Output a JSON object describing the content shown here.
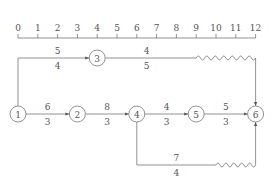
{
  "timescale": {
    "ticks": [
      "0",
      "1",
      "2",
      "3",
      "4",
      "5",
      "6",
      "7",
      "8",
      "9",
      "10",
      "11",
      "12"
    ]
  },
  "nodes": [
    {
      "id": "1",
      "label": "1",
      "time": 0,
      "row": "middle"
    },
    {
      "id": "2",
      "label": "2",
      "time": 3,
      "row": "middle"
    },
    {
      "id": "3",
      "label": "3",
      "time": 4,
      "row": "top"
    },
    {
      "id": "4",
      "label": "4",
      "time": 6,
      "row": "middle"
    },
    {
      "id": "5",
      "label": "5",
      "time": 9,
      "row": "middle"
    },
    {
      "id": "6",
      "label": "6",
      "time": 12,
      "row": "middle"
    }
  ],
  "activities": [
    {
      "from": "1",
      "to": "3",
      "name": "5",
      "duration": "4",
      "route": "up-right",
      "free_float": 0
    },
    {
      "from": "3",
      "to": "6",
      "name": "4",
      "duration": "5",
      "route": "right-down",
      "free_float": 3
    },
    {
      "from": "1",
      "to": "2",
      "name": "6",
      "duration": "3",
      "route": "straight",
      "free_float": 0
    },
    {
      "from": "2",
      "to": "4",
      "name": "8",
      "duration": "3",
      "route": "straight",
      "free_float": 0
    },
    {
      "from": "4",
      "to": "5",
      "name": "4",
      "duration": "3",
      "route": "straight",
      "free_float": 0
    },
    {
      "from": "5",
      "to": "6",
      "name": "5",
      "duration": "3",
      "route": "straight",
      "free_float": 0
    },
    {
      "from": "4",
      "to": "6",
      "name": "7",
      "duration": "4",
      "route": "down-right-up",
      "free_float": 2
    }
  ],
  "colors": {
    "line": "#777777",
    "text": "#555555"
  }
}
